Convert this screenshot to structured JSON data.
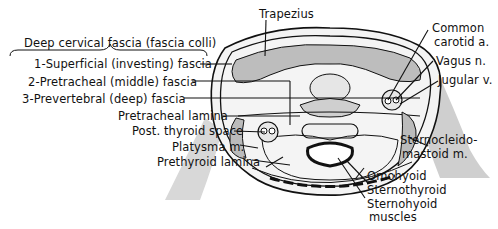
{
  "figure": {
    "group_heading": "Deep cervical fascia (fascia colli)",
    "fascia_layers": [
      {
        "label": "1-Superficial (investing) fascia"
      },
      {
        "label": "2-Pretracheal (middle) fascia"
      },
      {
        "label": "3-Prevertebral (deep) fascia"
      }
    ],
    "left_labels": [
      {
        "label": "Pretracheal lamina"
      },
      {
        "label": "Post. thyroid space"
      },
      {
        "label": "Platysma m."
      },
      {
        "label": "Prethyroid lamina"
      }
    ],
    "top_label": "Trapezius",
    "right_labels": [
      {
        "label": "Common carotid a.",
        "line1": "Common",
        "line2": "carotid a."
      },
      {
        "label": "Vagus n."
      },
      {
        "label": "Jugular v."
      },
      {
        "label": "Sternocleido-mastoid m.",
        "line1": "Sternocleido-",
        "line2": "mastoid m."
      }
    ],
    "bottom_labels": [
      {
        "label": "Omohyoid"
      },
      {
        "label": "Sternothyroid"
      },
      {
        "label": "Sternohyoid"
      },
      {
        "label": "muscles"
      }
    ],
    "colors": {
      "ink": "#111111",
      "shade": "#9a9a9a",
      "background": "#ffffff"
    }
  }
}
